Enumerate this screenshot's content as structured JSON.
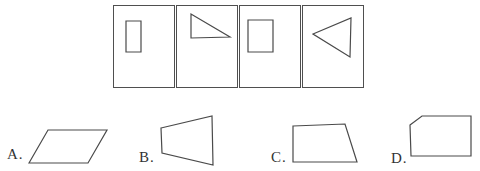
{
  "figure": {
    "kind": "shape-sequence-multiple-choice-question",
    "background_color": "#ffffff",
    "line_color": "#4a4a4a",
    "label_color": "#333333"
  },
  "question_strip": {
    "description": "row of four framed cells, each containing one outlined shape",
    "cells": [
      {
        "shape": "tall-rectangle",
        "points": "12,15 27,15 27,46 12,46"
      },
      {
        "shape": "right-triangle",
        "points": "14,8 14,32 53,31"
      },
      {
        "shape": "rectangle",
        "points": "8,14 33,14 33,46 8,46"
      },
      {
        "shape": "left-pointing-triangle",
        "points": "10,28 48,12 47,51"
      }
    ]
  },
  "options": [
    {
      "label": "A.",
      "shape": "parallelogram",
      "points": "2,35 21,2 80,2 61,35"
    },
    {
      "label": "B.",
      "shape": "irregular-quadrilateral",
      "points": "2,14 53,2 54,51 3,39"
    },
    {
      "label": "C.",
      "shape": "right-trapezoid",
      "points": "2,4 54,2 66,40 2,40"
    },
    {
      "label": "D.",
      "shape": "clipped-corner-pentagon",
      "points": "2,11 14,2 63,2 63,42 3,42"
    }
  ]
}
